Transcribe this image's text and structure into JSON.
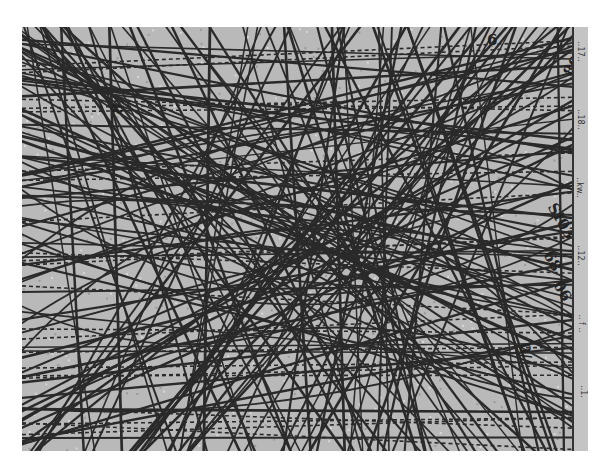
{
  "image": {
    "description": "Scanned grayscale map with dense overlapping route lines",
    "background_color": "#b9b9b9",
    "line_color": "#2a2a2a",
    "page_color": "#ffffff"
  },
  "labels": [
    {
      "text": "6",
      "x": 465,
      "y": 4,
      "rotate": 0
    },
    {
      "text": "8",
      "x": 90,
      "y": 73,
      "rotate": -80
    },
    {
      "text": "80",
      "x": 540,
      "y": 30,
      "rotate": -60
    },
    {
      "text": "SI03",
      "x": 520,
      "y": 185,
      "rotate": 60
    },
    {
      "text": "68",
      "x": 520,
      "y": 225,
      "rotate": 60
    },
    {
      "text": "06",
      "x": 530,
      "y": 255,
      "rotate": 60
    },
    {
      "text": "0/",
      "x": 495,
      "y": 315,
      "rotate": 80
    }
  ],
  "margin": {
    "texts": [
      "..17..",
      "..18..",
      "..kw..",
      "..12..",
      ".. f ..",
      "..1."
    ]
  }
}
